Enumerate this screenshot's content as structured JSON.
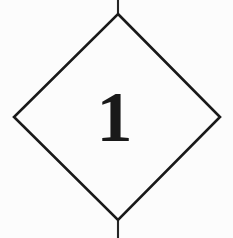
{
  "figure": {
    "kind": "diamond-placard-mark",
    "background_color": "#fcfcfc",
    "ink_color": "#191919",
    "canvas": {
      "width": 233,
      "height": 238
    }
  },
  "diamond": {
    "name": "diamond-outline",
    "stroke_color": "#191919",
    "stroke_width": 2.6,
    "fill": "none",
    "vertices": {
      "top": {
        "x": 118,
        "y": 14
      },
      "right": {
        "x": 220,
        "y": 117
      },
      "bottom": {
        "x": 118,
        "y": 220
      },
      "left": {
        "x": 14,
        "y": 117
      }
    },
    "path": "M 118 14 L 220 117 L 118 220 L 14 117 Z"
  },
  "tick_marks": [
    {
      "name": "top-tick",
      "label": "top registration tick",
      "x": 118,
      "y1": 0,
      "y2": 15,
      "stroke_width": 2.1,
      "stroke_color": "#262626"
    },
    {
      "name": "bottom-tick",
      "label": "bottom registration tick",
      "x": 118,
      "y1": 219,
      "y2": 238,
      "stroke_width": 2.1,
      "stroke_color": "#262626"
    }
  ],
  "numeral": {
    "name": "placard-numeral",
    "value": "1",
    "color": "#191919",
    "font_size_px": 72,
    "weight": "bold",
    "style": "serif",
    "center": {
      "x": 115,
      "y": 115
    }
  }
}
